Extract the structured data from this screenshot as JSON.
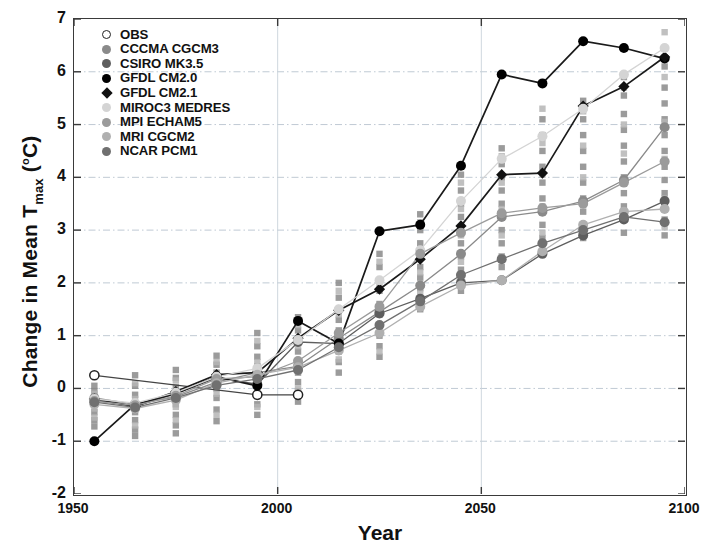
{
  "chart_data": {
    "type": "line",
    "title": "",
    "xlabel": "Year",
    "ylabel": "Change in Mean T_max (°C)",
    "ylabel_parts": {
      "pre": "Change in Mean T",
      "sub": "max",
      "unit_open": " (",
      "sup": "o",
      "unit_rest": "C)"
    },
    "xlim": [
      1950,
      2100
    ],
    "ylim": [
      -2,
      7
    ],
    "xticks": [
      1950,
      2000,
      2050,
      2100
    ],
    "yticks": [
      -2,
      -1,
      0,
      1,
      2,
      3,
      4,
      5,
      6,
      7
    ],
    "grid": true,
    "grid_style": "dash-dot light gray horizontal at each integer, light vertical at 2000 and 2050",
    "legend_position": "top-left inside axes",
    "x": [
      1955,
      1965,
      1975,
      1985,
      1995,
      2005,
      2015,
      2025,
      2035,
      2045,
      2055,
      2065,
      2075,
      2085,
      2095
    ],
    "series": [
      {
        "name": "OBS",
        "marker": "open-circle",
        "color": "#ffffff",
        "edge_color": "#222222",
        "x": [
          1955,
          1995,
          2005
        ],
        "values": [
          0.25,
          -0.12,
          -0.12
        ]
      },
      {
        "name": "CCCMA CGCM3",
        "marker": "circle",
        "color": "#8a8a8a",
        "values": [
          -0.18,
          -0.3,
          -0.16,
          0.12,
          0.3,
          0.42,
          0.95,
          1.45,
          1.95,
          2.55,
          3.25,
          3.35,
          3.55,
          3.95,
          4.95
        ]
      },
      {
        "name": "CSIRO MK3.5",
        "marker": "circle",
        "color": "#5e5e5e",
        "values": [
          -0.22,
          -0.34,
          -0.1,
          0.2,
          0.08,
          0.88,
          0.85,
          1.42,
          1.7,
          2.0,
          2.05,
          2.55,
          2.9,
          3.2,
          3.55
        ]
      },
      {
        "name": "GFDL CM2.0",
        "marker": "circle",
        "color": "#000000",
        "values": [
          -1.0,
          -0.3,
          -0.1,
          0.22,
          0.05,
          1.28,
          0.85,
          2.98,
          3.1,
          4.22,
          5.95,
          5.78,
          6.58,
          6.45,
          6.25
        ]
      },
      {
        "name": "GFDL CM2.1",
        "marker": "diamond",
        "color": "#111111",
        "values": [
          -0.2,
          -0.34,
          -0.06,
          0.26,
          0.3,
          0.95,
          1.48,
          1.88,
          2.45,
          3.08,
          4.05,
          4.08,
          5.35,
          5.72,
          6.28
        ]
      },
      {
        "name": "MIROC3 MEDRES",
        "marker": "circle",
        "color": "#d4d4d4",
        "values": [
          -0.2,
          -0.28,
          -0.08,
          0.22,
          0.38,
          0.92,
          1.5,
          2.05,
          2.62,
          3.55,
          4.35,
          4.78,
          5.3,
          5.95,
          6.45
        ]
      },
      {
        "name": "MPI ECHAM5",
        "marker": "circle",
        "color": "#9b9b9b",
        "values": [
          -0.24,
          -0.32,
          -0.14,
          0.18,
          0.22,
          0.52,
          1.05,
          1.55,
          2.55,
          2.95,
          3.32,
          3.42,
          3.5,
          3.9,
          4.3
        ]
      },
      {
        "name": "MRI CGCM2",
        "marker": "circle",
        "color": "#b0b0b0",
        "values": [
          -0.3,
          -0.38,
          -0.22,
          0.1,
          0.26,
          0.4,
          0.72,
          1.05,
          1.55,
          1.95,
          2.05,
          2.6,
          3.1,
          3.35,
          3.4
        ]
      },
      {
        "name": "NCAR PCM1",
        "marker": "circle",
        "color": "#707070",
        "values": [
          -0.26,
          -0.36,
          -0.18,
          0.06,
          0.18,
          0.35,
          0.78,
          1.2,
          1.65,
          2.15,
          2.45,
          2.75,
          3.0,
          3.25,
          3.15
        ]
      }
    ],
    "scatter_note": "Each decade shows a vertical cluster of gray square ensemble-member markers spread around the model means.",
    "scatter_squares": [
      {
        "x": 1955,
        "color": "#8a8a8a",
        "values": [
          0.05,
          -0.05,
          -0.18,
          -0.3,
          -0.45,
          -0.6,
          -0.72
        ]
      },
      {
        "x": 1955,
        "color": "#b5b5b5",
        "values": [
          -0.1,
          -0.25,
          -0.38,
          -0.55
        ]
      },
      {
        "x": 1965,
        "color": "#8a8a8a",
        "values": [
          0.25,
          0.05,
          -0.12,
          -0.3,
          -0.45,
          -0.6,
          -0.78,
          -0.9
        ]
      },
      {
        "x": 1965,
        "color": "#b5b5b5",
        "values": [
          0.1,
          -0.2,
          -0.4,
          -0.7
        ]
      },
      {
        "x": 1975,
        "color": "#8a8a8a",
        "values": [
          0.35,
          0.2,
          0.02,
          -0.12,
          -0.3,
          -0.5,
          -0.7,
          -0.85
        ]
      },
      {
        "x": 1975,
        "color": "#b5b5b5",
        "values": [
          0.15,
          -0.05,
          -0.35,
          -0.6
        ]
      },
      {
        "x": 1985,
        "color": "#8a8a8a",
        "values": [
          0.62,
          0.45,
          0.3,
          0.15,
          0.0,
          -0.18,
          -0.4,
          -0.62
        ]
      },
      {
        "x": 1985,
        "color": "#b5b5b5",
        "values": [
          0.5,
          0.2,
          -0.1,
          -0.5
        ]
      },
      {
        "x": 1995,
        "color": "#8a8a8a",
        "values": [
          1.05,
          0.8,
          0.6,
          0.42,
          0.25,
          0.08,
          -0.1,
          -0.3,
          -0.5
        ]
      },
      {
        "x": 1995,
        "color": "#b5b5b5",
        "values": [
          0.9,
          0.5,
          0.15,
          -0.35
        ]
      },
      {
        "x": 2005,
        "color": "#8a8a8a",
        "values": [
          1.35,
          1.1,
          0.9,
          0.7,
          0.5,
          0.3,
          0.12,
          -0.05,
          -0.25
        ]
      },
      {
        "x": 2005,
        "color": "#b5b5b5",
        "values": [
          1.2,
          0.8,
          0.4,
          0.0
        ]
      },
      {
        "x": 2015,
        "color": "#8a8a8a",
        "values": [
          2.0,
          1.72,
          1.5,
          1.3,
          1.1,
          0.9,
          0.7,
          0.5,
          0.3
        ]
      },
      {
        "x": 2015,
        "color": "#b5b5b5",
        "values": [
          1.85,
          1.4,
          1.0,
          0.55
        ]
      },
      {
        "x": 2025,
        "color": "#8a8a8a",
        "values": [
          2.55,
          2.3,
          2.05,
          1.85,
          1.6,
          1.4,
          1.2,
          1.0,
          0.8,
          0.6
        ]
      },
      {
        "x": 2025,
        "color": "#b5b5b5",
        "values": [
          2.4,
          1.95,
          1.5,
          1.05,
          0.7
        ]
      },
      {
        "x": 2035,
        "color": "#8a8a8a",
        "values": [
          3.3,
          3.0,
          2.75,
          2.5,
          2.3,
          2.1,
          1.9,
          1.7,
          1.5
        ]
      },
      {
        "x": 2035,
        "color": "#b5b5b5",
        "values": [
          3.15,
          2.6,
          2.2,
          1.8
        ]
      },
      {
        "x": 2045,
        "color": "#8a8a8a",
        "values": [
          4.05,
          3.75,
          3.5,
          3.25,
          3.0,
          2.75,
          2.5,
          2.25,
          2.05,
          1.85
        ]
      },
      {
        "x": 2045,
        "color": "#b5b5b5",
        "values": [
          3.9,
          3.4,
          2.9,
          2.4,
          2.0
        ]
      },
      {
        "x": 2055,
        "color": "#8a8a8a",
        "values": [
          4.55,
          4.25,
          4.0,
          3.75,
          3.5,
          3.25,
          3.0,
          2.75,
          2.5,
          2.3
        ]
      },
      {
        "x": 2055,
        "color": "#b5b5b5",
        "values": [
          4.4,
          3.9,
          3.4,
          2.9,
          2.45
        ]
      },
      {
        "x": 2065,
        "color": "#8a8a8a",
        "values": [
          5.1,
          4.8,
          4.5,
          4.2,
          3.9,
          3.6,
          3.35,
          3.1,
          2.85,
          2.6
        ]
      },
      {
        "x": 2065,
        "color": "#b5b5b5",
        "values": [
          5.3,
          4.65,
          4.05,
          3.45,
          2.95
        ]
      },
      {
        "x": 2075,
        "color": "#8a8a8a",
        "values": [
          5.45,
          5.1,
          4.8,
          4.5,
          4.2,
          3.9,
          3.6,
          3.35,
          3.1,
          2.85
        ]
      },
      {
        "x": 2075,
        "color": "#b5b5b5",
        "values": [
          5.25,
          4.6,
          4.0,
          3.5,
          3.0
        ]
      },
      {
        "x": 2085,
        "color": "#8a8a8a",
        "values": [
          5.9,
          5.55,
          5.2,
          4.9,
          4.6,
          4.3,
          4.0,
          3.7,
          3.45,
          3.2,
          2.95
        ]
      },
      {
        "x": 2085,
        "color": "#b5b5b5",
        "values": [
          5.7,
          5.0,
          4.45,
          3.9,
          3.3
        ]
      },
      {
        "x": 2095,
        "color": "#8a8a8a",
        "values": [
          6.45,
          6.1,
          5.7,
          5.4,
          5.1,
          4.8,
          4.5,
          4.2,
          3.95,
          3.7,
          3.45,
          3.2,
          2.9
        ]
      },
      {
        "x": 2095,
        "color": "#b5b5b5",
        "values": [
          6.75,
          6.25,
          5.9,
          5.05,
          4.35,
          3.6,
          3.05
        ]
      }
    ]
  },
  "legend": {
    "items": [
      {
        "label": "OBS",
        "marker": "open-circle",
        "color": "#ffffff"
      },
      {
        "label": "CCCMA CGCM3",
        "marker": "circle",
        "color": "#8a8a8a"
      },
      {
        "label": "CSIRO MK3.5",
        "marker": "circle",
        "color": "#5e5e5e"
      },
      {
        "label": "GFDL CM2.0",
        "marker": "circle",
        "color": "#000000"
      },
      {
        "label": "GFDL CM2.1",
        "marker": "diamond",
        "color": "#111111"
      },
      {
        "label": "MIROC3 MEDRES",
        "marker": "circle",
        "color": "#d4d4d4"
      },
      {
        "label": "MPI ECHAM5",
        "marker": "circle",
        "color": "#9b9b9b"
      },
      {
        "label": "MRI CGCM2",
        "marker": "circle",
        "color": "#b0b0b0"
      },
      {
        "label": "NCAR PCM1",
        "marker": "circle",
        "color": "#707070"
      }
    ]
  },
  "axes": {
    "x_title": "Year",
    "y_title_pre": "Change in Mean T",
    "y_title_sub": "max",
    "y_title_unit": "(°C)",
    "xticklabels": [
      "1950",
      "2000",
      "2050",
      "2100"
    ],
    "yticklabels": [
      "7",
      "6",
      "5",
      "4",
      "3",
      "2",
      "1",
      "0",
      "-1",
      "-2"
    ]
  }
}
